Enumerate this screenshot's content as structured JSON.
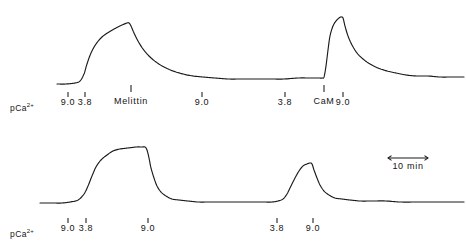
{
  "figure": {
    "background_color": "#ffffff",
    "trace_color": "#1a1a1a"
  },
  "axis": {
    "pca_label_prefix": "pCa",
    "pca_label_superscript": "2+"
  },
  "scale_bar": {
    "label": "10  min",
    "value": 10,
    "unit": "min"
  },
  "events": {
    "melittin": "Melittin",
    "cam": "CaM"
  },
  "chart_data": {
    "type": "line",
    "title": "",
    "xlabel": "",
    "ylabel": "",
    "grid": false,
    "legend": "none",
    "xlim": [
      0,
      466
    ],
    "ylim": [
      0,
      247
    ],
    "scale_bar": {
      "length_label": "10 min",
      "minutes": 10
    },
    "panels": [
      {
        "name": "top-trace",
        "pca_ticks": [
          {
            "label": "9.0",
            "x": 68
          },
          {
            "label": "3.8",
            "x": 85
          },
          {
            "label": "9.0",
            "x": 202
          },
          {
            "label": "3.8",
            "x": 285
          },
          {
            "label": "9.0",
            "x": 343
          }
        ],
        "event_markers": [
          {
            "label": "Melittin",
            "x": 131
          },
          {
            "label": "CaM",
            "x": 324
          }
        ],
        "baseline_y": 84,
        "peak1": {
          "x": 128,
          "y": 23
        },
        "peak2": {
          "x": 341,
          "y": 17
        },
        "points": [
          [
            57,
            84
          ],
          [
            66,
            84
          ],
          [
            75,
            83
          ],
          [
            80,
            81
          ],
          [
            84,
            74
          ],
          [
            87,
            64
          ],
          [
            91,
            53
          ],
          [
            96,
            44
          ],
          [
            102,
            37
          ],
          [
            109,
            32
          ],
          [
            116,
            28
          ],
          [
            122,
            25
          ],
          [
            127,
            23
          ],
          [
            129,
            23
          ],
          [
            131,
            26
          ],
          [
            134,
            33
          ],
          [
            138,
            41
          ],
          [
            143,
            49
          ],
          [
            149,
            56
          ],
          [
            156,
            62
          ],
          [
            164,
            67
          ],
          [
            173,
            71
          ],
          [
            183,
            74
          ],
          [
            193,
            76
          ],
          [
            203,
            77
          ],
          [
            215,
            78
          ],
          [
            228,
            79
          ],
          [
            242,
            79
          ],
          [
            256,
            79
          ],
          [
            270,
            79
          ],
          [
            284,
            79
          ],
          [
            298,
            78
          ],
          [
            310,
            78
          ],
          [
            318,
            78
          ],
          [
            322,
            78
          ],
          [
            324,
            77
          ],
          [
            326,
            66
          ],
          [
            328,
            50
          ],
          [
            330,
            36
          ],
          [
            333,
            26
          ],
          [
            336,
            21
          ],
          [
            339,
            18
          ],
          [
            341,
            17
          ],
          [
            343,
            18
          ],
          [
            345,
            26
          ],
          [
            348,
            36
          ],
          [
            352,
            45
          ],
          [
            357,
            53
          ],
          [
            363,
            59
          ],
          [
            370,
            64
          ],
          [
            378,
            68
          ],
          [
            387,
            71
          ],
          [
            396,
            73
          ],
          [
            406,
            75
          ],
          [
            417,
            76
          ],
          [
            428,
            76
          ],
          [
            440,
            77
          ],
          [
            452,
            77
          ],
          [
            464,
            77
          ]
        ]
      },
      {
        "name": "bottom-trace",
        "pca_ticks": [
          {
            "label": "9.0",
            "x": 68
          },
          {
            "label": "3.8",
            "x": 86
          },
          {
            "label": "9.0",
            "x": 148
          },
          {
            "label": "3.8",
            "x": 277
          },
          {
            "label": "9.0",
            "x": 313
          }
        ],
        "event_markers": [],
        "baseline_y": 202,
        "peak1": {
          "x": 145,
          "y": 147
        },
        "peak2": {
          "x": 310,
          "y": 163
        },
        "points": [
          [
            40,
            203
          ],
          [
            52,
            203
          ],
          [
            62,
            203
          ],
          [
            70,
            202
          ],
          [
            78,
            200
          ],
          [
            84,
            194
          ],
          [
            88,
            186
          ],
          [
            92,
            176
          ],
          [
            96,
            167
          ],
          [
            101,
            160
          ],
          [
            107,
            155
          ],
          [
            113,
            151
          ],
          [
            120,
            149
          ],
          [
            128,
            148
          ],
          [
            136,
            147
          ],
          [
            142,
            147
          ],
          [
            145,
            147
          ],
          [
            147,
            150
          ],
          [
            149,
            158
          ],
          [
            151,
            168
          ],
          [
            154,
            178
          ],
          [
            157,
            186
          ],
          [
            161,
            192
          ],
          [
            166,
            196
          ],
          [
            172,
            199
          ],
          [
            179,
            200
          ],
          [
            188,
            201
          ],
          [
            198,
            202
          ],
          [
            210,
            202
          ],
          [
            222,
            202
          ],
          [
            236,
            202
          ],
          [
            250,
            202
          ],
          [
            262,
            202
          ],
          [
            272,
            202
          ],
          [
            278,
            201
          ],
          [
            283,
            199
          ],
          [
            287,
            194
          ],
          [
            291,
            186
          ],
          [
            295,
            178
          ],
          [
            299,
            171
          ],
          [
            303,
            166
          ],
          [
            307,
            164
          ],
          [
            310,
            163
          ],
          [
            312,
            164
          ],
          [
            314,
            170
          ],
          [
            317,
            178
          ],
          [
            320,
            185
          ],
          [
            324,
            191
          ],
          [
            329,
            195
          ],
          [
            335,
            198
          ],
          [
            342,
            199
          ],
          [
            350,
            200
          ],
          [
            360,
            201
          ],
          [
            372,
            201
          ],
          [
            386,
            201
          ],
          [
            400,
            202
          ],
          [
            416,
            202
          ],
          [
            432,
            202
          ],
          [
            448,
            202
          ],
          [
            464,
            202
          ]
        ]
      }
    ]
  },
  "labels": {
    "top": {
      "pca_row_y": 108,
      "tick_row_y": 97
    },
    "bottom": {
      "pca_row_y": 234,
      "tick_row_y": 223
    }
  }
}
